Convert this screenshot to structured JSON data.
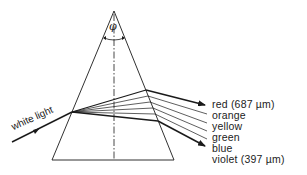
{
  "diagram": {
    "type": "prism-dispersion",
    "input_label": "white light",
    "apex_angle_symbol": "φ",
    "spectrum_labels": [
      {
        "color": "red",
        "text": "red (687 µm)"
      },
      {
        "color": "orange",
        "text": "orange"
      },
      {
        "color": "yellow",
        "text": "yellow"
      },
      {
        "color": "green",
        "text": "green"
      },
      {
        "color": "blue",
        "text": "blue"
      },
      {
        "color": "violet",
        "text": "violet (397 µm)"
      }
    ],
    "line_color": "#1a1a1a"
  }
}
